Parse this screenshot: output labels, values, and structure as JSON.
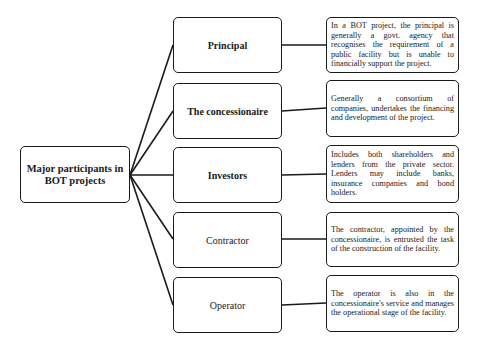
{
  "diagram": {
    "hub": {
      "label": "Major participants in BOT projects"
    },
    "participants": [
      {
        "label": "Principal",
        "bold": true,
        "description": "In a BOT project, the principal is generally a govt. agency that recognises the requirement of a public facility but is unable to financially support the project."
      },
      {
        "label": "The concessionaire",
        "bold": true,
        "description": "Generally a consortium of companies, undertakes the financing and development of the project."
      },
      {
        "label": "Investors",
        "bold": true,
        "description": "Includes both shareholders and lenders from the private sector. Lenders may include banks, insurance companies and bond holders."
      },
      {
        "label": "Contractor",
        "bold": false,
        "description": "The contractor, appointed by the concessionaire, is entrusted the task of the construction of the facility."
      },
      {
        "label": "Operator",
        "bold": false,
        "description": "The operator is also in the concessionaire's service and manages the operational stage of the facility."
      }
    ],
    "colors": {
      "line": "#1a1a1a",
      "box_fill": "#ffffff",
      "border": "#1a1a1a"
    }
  }
}
